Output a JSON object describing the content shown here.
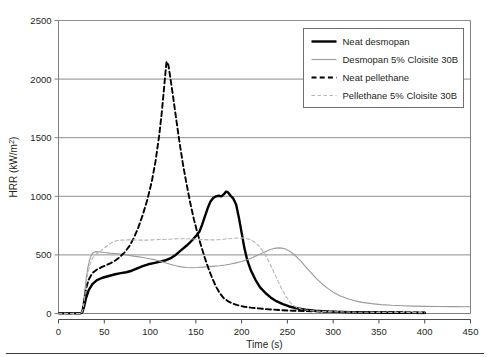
{
  "figure": {
    "background": "#ffffff",
    "has_bottom_rule": true
  },
  "chart_data": {
    "type": "line",
    "title": "",
    "subtitle": "",
    "xlabel": "Time (s)",
    "ylabel": "HRR (kW/m²)",
    "xlim": [
      0,
      450
    ],
    "ylim": [
      0,
      2500
    ],
    "xticks": [
      0,
      50,
      100,
      150,
      200,
      250,
      300,
      350,
      400,
      450
    ],
    "yticks": [
      0,
      500,
      1000,
      1500,
      2000,
      2500
    ],
    "xtick_labels": [
      "0",
      "50",
      "100",
      "150",
      "200",
      "250",
      "300",
      "350",
      "400",
      "450"
    ],
    "ytick_labels": [
      "0",
      "500",
      "1000",
      "1500",
      "2000",
      "2500"
    ],
    "grid": "horizontal",
    "grid_color": "#808080",
    "legend_position": "top-right",
    "series": [
      {
        "name": "Neat desmopan",
        "color": "#000000",
        "style": "solid",
        "width": 2.4,
        "peak_value": 1040,
        "peak_time": 181,
        "points": [
          [
            0,
            0
          ],
          [
            24,
            0
          ],
          [
            26,
            10
          ],
          [
            28,
            60
          ],
          [
            30,
            130
          ],
          [
            33,
            200
          ],
          [
            37,
            250
          ],
          [
            42,
            285
          ],
          [
            48,
            305
          ],
          [
            55,
            320
          ],
          [
            62,
            335
          ],
          [
            68,
            345
          ],
          [
            74,
            352
          ],
          [
            80,
            365
          ],
          [
            86,
            385
          ],
          [
            92,
            405
          ],
          [
            98,
            420
          ],
          [
            104,
            430
          ],
          [
            110,
            440
          ],
          [
            116,
            452
          ],
          [
            122,
            470
          ],
          [
            128,
            500
          ],
          [
            134,
            540
          ],
          [
            140,
            580
          ],
          [
            146,
            625
          ],
          [
            150,
            660
          ],
          [
            154,
            700
          ],
          [
            157,
            760
          ],
          [
            160,
            830
          ],
          [
            163,
            900
          ],
          [
            166,
            955
          ],
          [
            169,
            985
          ],
          [
            172,
            1000
          ],
          [
            175,
            1005
          ],
          [
            178,
            1000
          ],
          [
            181,
            1020
          ],
          [
            183,
            1040
          ],
          [
            185,
            1035
          ],
          [
            188,
            1005
          ],
          [
            191,
            980
          ],
          [
            194,
            930
          ],
          [
            197,
            820
          ],
          [
            200,
            690
          ],
          [
            203,
            560
          ],
          [
            206,
            460
          ],
          [
            210,
            370
          ],
          [
            215,
            290
          ],
          [
            220,
            225
          ],
          [
            226,
            175
          ],
          [
            232,
            135
          ],
          [
            238,
            105
          ],
          [
            245,
            80
          ],
          [
            252,
            60
          ],
          [
            260,
            45
          ],
          [
            270,
            32
          ],
          [
            280,
            24
          ],
          [
            292,
            18
          ],
          [
            305,
            14
          ],
          [
            320,
            11
          ],
          [
            340,
            8
          ],
          [
            360,
            6
          ],
          [
            380,
            5
          ],
          [
            400,
            4
          ]
        ]
      },
      {
        "name": "Desmopan 5% Cloisite 30B",
        "color": "#9a9a9a",
        "style": "solid",
        "width": 1.1,
        "peak_value": 560,
        "peak_time": 238,
        "points": [
          [
            0,
            0
          ],
          [
            24,
            0
          ],
          [
            26,
            30
          ],
          [
            28,
            140
          ],
          [
            30,
            280
          ],
          [
            32,
            390
          ],
          [
            34,
            460
          ],
          [
            36,
            500
          ],
          [
            38,
            520
          ],
          [
            41,
            528
          ],
          [
            45,
            525
          ],
          [
            50,
            520
          ],
          [
            56,
            515
          ],
          [
            62,
            512
          ],
          [
            68,
            508
          ],
          [
            74,
            500
          ],
          [
            80,
            492
          ],
          [
            86,
            485
          ],
          [
            92,
            478
          ],
          [
            98,
            470
          ],
          [
            104,
            460
          ],
          [
            110,
            448
          ],
          [
            116,
            435
          ],
          [
            122,
            420
          ],
          [
            128,
            408
          ],
          [
            134,
            398
          ],
          [
            140,
            392
          ],
          [
            146,
            390
          ],
          [
            152,
            392
          ],
          [
            158,
            396
          ],
          [
            164,
            400
          ],
          [
            170,
            404
          ],
          [
            176,
            408
          ],
          [
            182,
            414
          ],
          [
            188,
            422
          ],
          [
            194,
            432
          ],
          [
            200,
            444
          ],
          [
            206,
            458
          ],
          [
            212,
            478
          ],
          [
            218,
            500
          ],
          [
            224,
            520
          ],
          [
            230,
            542
          ],
          [
            236,
            556
          ],
          [
            240,
            560
          ],
          [
            244,
            558
          ],
          [
            248,
            550
          ],
          [
            252,
            534
          ],
          [
            256,
            512
          ],
          [
            260,
            484
          ],
          [
            265,
            444
          ],
          [
            270,
            398
          ],
          [
            276,
            346
          ],
          [
            282,
            296
          ],
          [
            288,
            252
          ],
          [
            294,
            214
          ],
          [
            300,
            182
          ],
          [
            308,
            150
          ],
          [
            316,
            126
          ],
          [
            324,
            108
          ],
          [
            332,
            95
          ],
          [
            342,
            84
          ],
          [
            352,
            76
          ],
          [
            364,
            70
          ],
          [
            376,
            66
          ],
          [
            388,
            63
          ],
          [
            400,
            61
          ],
          [
            415,
            60
          ],
          [
            430,
            59
          ],
          [
            450,
            58
          ]
        ]
      },
      {
        "name": "Neat pellethane",
        "color": "#000000",
        "style": "dashed",
        "width": 1.9,
        "peak_value": 2150,
        "peak_time": 118,
        "points": [
          [
            0,
            0
          ],
          [
            24,
            0
          ],
          [
            26,
            20
          ],
          [
            28,
            110
          ],
          [
            30,
            210
          ],
          [
            33,
            290
          ],
          [
            37,
            345
          ],
          [
            42,
            375
          ],
          [
            47,
            395
          ],
          [
            52,
            412
          ],
          [
            57,
            430
          ],
          [
            62,
            452
          ],
          [
            67,
            482
          ],
          [
            72,
            520
          ],
          [
            77,
            570
          ],
          [
            82,
            640
          ],
          [
            87,
            730
          ],
          [
            92,
            840
          ],
          [
            97,
            970
          ],
          [
            102,
            1130
          ],
          [
            106,
            1300
          ],
          [
            110,
            1520
          ],
          [
            113,
            1730
          ],
          [
            115,
            1900
          ],
          [
            117,
            2070
          ],
          [
            118,
            2150
          ],
          [
            120,
            2120
          ],
          [
            122,
            2020
          ],
          [
            125,
            1860
          ],
          [
            128,
            1690
          ],
          [
            132,
            1470
          ],
          [
            136,
            1270
          ],
          [
            140,
            1100
          ],
          [
            144,
            940
          ],
          [
            148,
            800
          ],
          [
            152,
            680
          ],
          [
            156,
            570
          ],
          [
            160,
            470
          ],
          [
            164,
            380
          ],
          [
            168,
            300
          ],
          [
            172,
            230
          ],
          [
            176,
            175
          ],
          [
            180,
            135
          ],
          [
            185,
            105
          ],
          [
            190,
            85
          ],
          [
            196,
            70
          ],
          [
            203,
            58
          ],
          [
            210,
            50
          ],
          [
            218,
            44
          ],
          [
            226,
            38
          ],
          [
            235,
            33
          ],
          [
            245,
            28
          ],
          [
            256,
            24
          ],
          [
            268,
            21
          ],
          [
            282,
            18
          ],
          [
            298,
            16
          ],
          [
            315,
            14
          ],
          [
            335,
            12
          ],
          [
            358,
            11
          ],
          [
            380,
            10
          ],
          [
            400,
            9
          ]
        ]
      },
      {
        "name": "Pellethane 5% Cloisite 30B",
        "color": "#b4b4b4",
        "style": "dashed",
        "width": 1.1,
        "peak_value": 645,
        "peak_time": 200,
        "points": [
          [
            0,
            0
          ],
          [
            25,
            0
          ],
          [
            27,
            40
          ],
          [
            29,
            160
          ],
          [
            31,
            300
          ],
          [
            34,
            410
          ],
          [
            37,
            470
          ],
          [
            40,
            500
          ],
          [
            44,
            520
          ],
          [
            48,
            545
          ],
          [
            52,
            570
          ],
          [
            56,
            595
          ],
          [
            60,
            612
          ],
          [
            64,
            622
          ],
          [
            68,
            626
          ],
          [
            73,
            628
          ],
          [
            78,
            628
          ],
          [
            84,
            627
          ],
          [
            90,
            626
          ],
          [
            96,
            626
          ],
          [
            102,
            628
          ],
          [
            108,
            630
          ],
          [
            114,
            632
          ],
          [
            120,
            634
          ],
          [
            126,
            636
          ],
          [
            132,
            638
          ],
          [
            138,
            638
          ],
          [
            144,
            636
          ],
          [
            150,
            634
          ],
          [
            156,
            632
          ],
          [
            160,
            630
          ],
          [
            165,
            628
          ],
          [
            170,
            628
          ],
          [
            175,
            630
          ],
          [
            180,
            634
          ],
          [
            186,
            638
          ],
          [
            192,
            642
          ],
          [
            197,
            645
          ],
          [
            200,
            645
          ],
          [
            204,
            642
          ],
          [
            208,
            634
          ],
          [
            212,
            620
          ],
          [
            216,
            598
          ],
          [
            220,
            566
          ],
          [
            224,
            524
          ],
          [
            228,
            470
          ],
          [
            232,
            408
          ],
          [
            236,
            340
          ],
          [
            240,
            272
          ],
          [
            244,
            208
          ],
          [
            248,
            150
          ],
          [
            252,
            104
          ],
          [
            256,
            72
          ],
          [
            260,
            52
          ],
          [
            265,
            38
          ],
          [
            270,
            30
          ],
          [
            276,
            24
          ],
          [
            283,
            20
          ],
          [
            291,
            17
          ],
          [
            300,
            15
          ],
          [
            312,
            13
          ],
          [
            326,
            11
          ],
          [
            342,
            10
          ],
          [
            360,
            9
          ],
          [
            380,
            8
          ],
          [
            400,
            7
          ]
        ]
      }
    ]
  },
  "legend": {
    "entries": [
      {
        "label": "Neat desmopan"
      },
      {
        "label": "Desmopan 5% Cloisite 30B"
      },
      {
        "label": "Neat pellethane"
      },
      {
        "label": "Pellethane 5% Cloisite 30B"
      }
    ]
  }
}
